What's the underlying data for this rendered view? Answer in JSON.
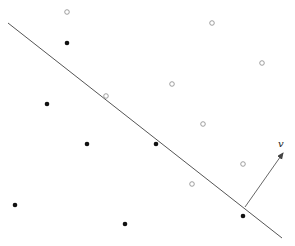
{
  "diagram": {
    "type": "linear-separator",
    "width": 295,
    "height": 246,
    "background": "#ffffff",
    "separating_line": {
      "x1": 8,
      "y1": 23,
      "x2": 282,
      "y2": 238,
      "color": "#555555",
      "width": 1
    },
    "normal_vector": {
      "label": "v",
      "x1": 245,
      "y1": 207,
      "x2": 283,
      "y2": 153,
      "color": "#555555",
      "label_x": 278,
      "label_y": 147
    },
    "positive_points": {
      "style": "open-circle",
      "color": "#888888",
      "radius": 2.3,
      "points": [
        {
          "x": 67,
          "y": 12
        },
        {
          "x": 212,
          "y": 23
        },
        {
          "x": 262,
          "y": 63
        },
        {
          "x": 172,
          "y": 84
        },
        {
          "x": 106,
          "y": 96
        },
        {
          "x": 203,
          "y": 124
        },
        {
          "x": 243,
          "y": 164
        },
        {
          "x": 192,
          "y": 184
        }
      ]
    },
    "negative_points": {
      "style": "filled-circle",
      "color": "#111111",
      "radius": 2.3,
      "points": [
        {
          "x": 67,
          "y": 43
        },
        {
          "x": 47,
          "y": 104
        },
        {
          "x": 87,
          "y": 144
        },
        {
          "x": 156,
          "y": 144
        },
        {
          "x": 15,
          "y": 205
        },
        {
          "x": 125,
          "y": 224
        },
        {
          "x": 243,
          "y": 216
        }
      ]
    }
  }
}
